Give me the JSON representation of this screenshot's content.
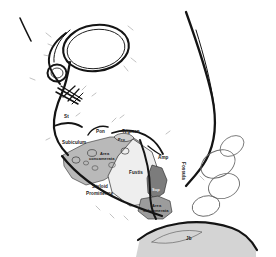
{
  "figure": {
    "kind": "anatomical-line-drawing",
    "background_color": "#ffffff",
    "ink_color": "#141414",
    "width": 276,
    "height": 257
  },
  "labels": {
    "st": "St",
    "subiculum": "Subiculum",
    "pon": "Pon",
    "tegmen": "Tegmen",
    "pro": "Pro",
    "area_concamerata_line1": "Area",
    "area_concamerata_line2": "concamerata",
    "fustis": "Fustis",
    "styloid_line1": "Styloid",
    "styloid_line2": "Prominence",
    "amp": "Amp",
    "fossula": "Fossula",
    "sup": "Sup",
    "area_subcamerata_line1": "Area",
    "area_subcamerata_line2": "subcamerata",
    "jb": "Jb"
  },
  "regions": {
    "area_concamerata": {
      "name": "Area concamerata",
      "shade": "#b8b8b8"
    },
    "fustis": {
      "name": "Fustis",
      "shade": "#ededed"
    },
    "sinus_tympani": {
      "name": "Sinus tympani dark region",
      "shade": "#7a7a7a"
    },
    "area_subcamerata": {
      "name": "Area subcamerata",
      "shade": "#9a9a9a"
    },
    "jugular_bulb": {
      "name": "Jugular bulb",
      "shade": "#cfcfcf"
    },
    "promontory": {
      "name": "Promontory",
      "shade": "#d0d0d0"
    }
  },
  "structures": {
    "attic_oval": "large superior oval outline",
    "oval_window": "small circle inferior to attic",
    "hatch_bundle": "cross hatched ossicular bundle",
    "cochlear_turns": "right side spiral loops",
    "canal_outline": "external auditory canal outline"
  }
}
